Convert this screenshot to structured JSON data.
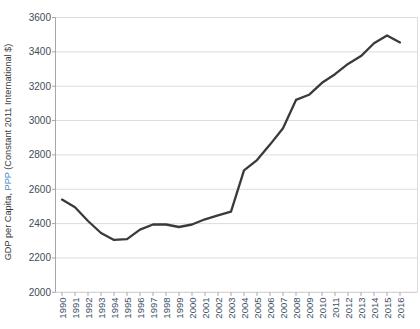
{
  "chart_data": {
    "type": "line",
    "title": "",
    "xlabel": "",
    "ylabel": "GDP per Capita, PPP (Constant 2011 International $)",
    "ylabel_segments": [
      {
        "text": "GDP per Capita, ",
        "color": "#3a3a3a"
      },
      {
        "text": "PPP",
        "color": "#4a86c6"
      },
      {
        "text": " (Constant 2011 International $)",
        "color": "#3a3a3a"
      }
    ],
    "x": [
      1990,
      1991,
      1992,
      1993,
      1994,
      1995,
      1996,
      1997,
      1998,
      1999,
      2000,
      2001,
      2002,
      2003,
      2004,
      2005,
      2006,
      2007,
      2008,
      2009,
      2010,
      2011,
      2012,
      2013,
      2014,
      2015,
      2016
    ],
    "series": [
      {
        "name": "GDP per Capita, PPP (Constant 2011 International $)",
        "values": [
          2540,
          2495,
          2415,
          2345,
          2305,
          2310,
          2365,
          2395,
          2395,
          2380,
          2395,
          2425,
          2448,
          2470,
          2710,
          2770,
          2860,
          2955,
          3120,
          3150,
          3220,
          3270,
          3330,
          3375,
          3450,
          3495,
          3455
        ]
      }
    ],
    "ylim": [
      2000,
      3600
    ],
    "yticks": [
      2000,
      2200,
      2400,
      2600,
      2800,
      3000,
      3200,
      3400,
      3600
    ],
    "grid": "horizontal",
    "legend": "none",
    "colors": {
      "line": "#3a3a3a",
      "grid": "#dcdcdc",
      "bottom_line": "#c9c9c9",
      "axis": "#a6a6a6",
      "tick": "#a6a6a6",
      "y_tick_label": "#424c56",
      "x_tick_label": "#3d5166",
      "background": "#ffffff"
    }
  }
}
